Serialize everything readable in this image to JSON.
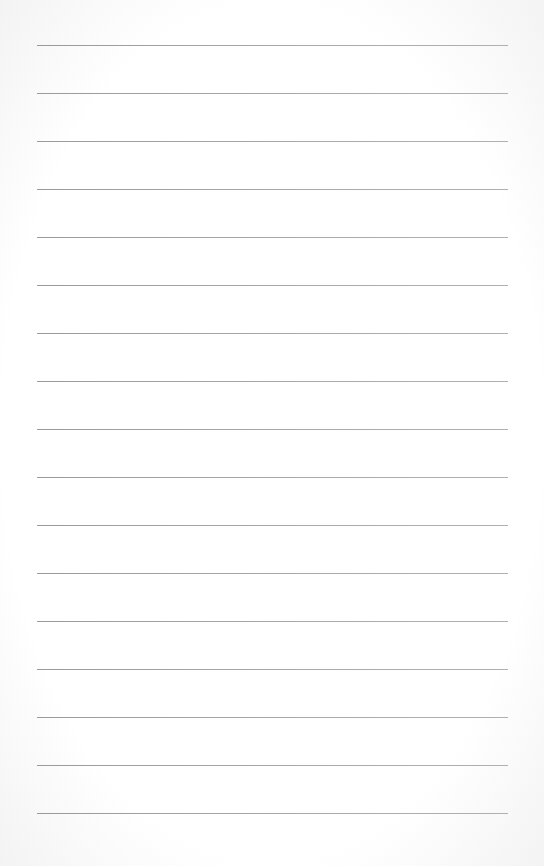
{
  "page": {
    "type": "lined-paper",
    "background_color": "#ffffff",
    "line_color": "#a0a0a0",
    "line_count": 17,
    "first_line_y": 45,
    "line_spacing": 48,
    "line_left_x": 37,
    "line_right_x": 508,
    "lines": [
      {
        "y": 45
      },
      {
        "y": 93
      },
      {
        "y": 141
      },
      {
        "y": 189
      },
      {
        "y": 237
      },
      {
        "y": 285
      },
      {
        "y": 333
      },
      {
        "y": 381
      },
      {
        "y": 429
      },
      {
        "y": 477
      },
      {
        "y": 525
      },
      {
        "y": 573
      },
      {
        "y": 621
      },
      {
        "y": 669
      },
      {
        "y": 717
      },
      {
        "y": 765
      },
      {
        "y": 813
      }
    ]
  }
}
